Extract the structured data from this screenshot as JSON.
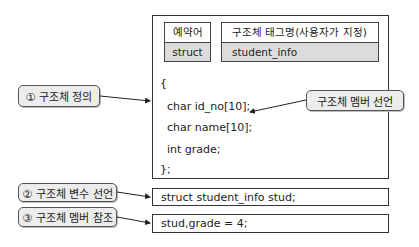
{
  "table": {
    "keyword_header": "예약어",
    "keyword_value": "struct",
    "tag_header": "구조체 태그명(사용자가 지정)",
    "tag_value": "student_info"
  },
  "code": {
    "lines": [
      "{",
      "  char id_no[10];",
      "  char name[10];",
      "  int grade;",
      "};"
    ]
  },
  "labels": {
    "definition": "① 구조체 정의",
    "member_declaration": "구조체 멤버 선언",
    "variable_declaration": "② 구조체 변수 선언",
    "member_reference": "③ 구조체 멤버 참조"
  },
  "statements": {
    "variable_declaration": "struct student_info stud;",
    "member_reference": "stud,grade = 4;"
  },
  "colors": {
    "label_fill": "#ececec",
    "table_body_fill": "#dcdcdc",
    "border": "#333333"
  }
}
